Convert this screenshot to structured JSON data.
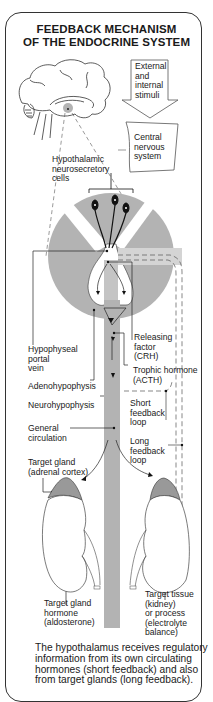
{
  "title": {
    "line1": "FEEDBACK MECHANISM",
    "line2": "OF THE ENDOCRINE SYSTEM"
  },
  "labels": {
    "external_stimuli": "External\nand\ninternal\nstimuli",
    "cns": "Central\nnervous\nsystem",
    "neurosecretory": "Hypothalamic\nneurosecretory\ncells",
    "releasing_factor": "Releasing\nfactor\n(CRH)",
    "portal_vein": "Hypophyseal\nportal\nvein",
    "trophic_hormone": "Trophic hormone\n(ACTH)",
    "adenohypophysis": "Adenohypophysis",
    "neurohypophysis": "Neurohypophysis",
    "short_feedback": "Short\nfeedback\nloop",
    "general_circulation": "General\ncirculation",
    "long_feedback": "Long\nfeedback\nloop",
    "target_gland": "Target gland\n(adrenal cortex)",
    "target_gland_hormone": "Target gland\nhormone\n(aldosterone)",
    "target_tissue": "Target tissue\n(kidney)\nor process\n(electrolyte\nbalance)"
  },
  "caption": "The hypothalamus receives regulatory information from its own circulating hormones (short feedback) and also from target glands (long feedback).",
  "colors": {
    "gray_fill": "#b3b3b3",
    "light_gray": "#d4d4d4",
    "line": "#222222",
    "frame": "#333333"
  }
}
